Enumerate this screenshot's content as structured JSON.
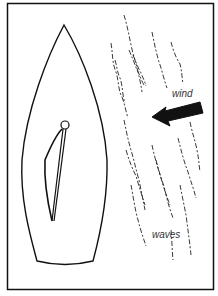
{
  "diagram": {
    "type": "illustration",
    "labels": {
      "wind": "wind",
      "waves": "waves"
    },
    "elements": {
      "hull": "boat-hull-outline",
      "mast": "mast-circle",
      "sail": "mainsail",
      "boom": "boom",
      "wind_arrow": "arrow-pointing-left",
      "wave_lines": "dashed-wavy-lines"
    },
    "colors": {
      "line": "#111111",
      "background": "#ffffff",
      "label": "#333333"
    }
  }
}
